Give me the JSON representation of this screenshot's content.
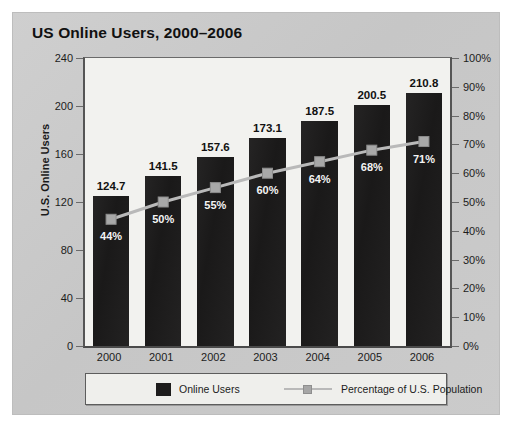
{
  "chart_data": {
    "type": "bar",
    "title": "US Online Users, 2000–2006",
    "categories": [
      "2000",
      "2001",
      "2002",
      "2003",
      "2004",
      "2005",
      "2006"
    ],
    "xlabel": "",
    "ylabel": "U.S. Online Users",
    "ylim": [
      0,
      240
    ],
    "yticks": [
      "0",
      "40",
      "80",
      "120",
      "160",
      "200",
      "240"
    ],
    "y2label": "",
    "y2lim": [
      0,
      100
    ],
    "y2ticks": [
      "0%",
      "10%",
      "20%",
      "30%",
      "40%",
      "50%",
      "60%",
      "70%",
      "80%",
      "90%",
      "100%"
    ],
    "grid": false,
    "legend_position": "bottom",
    "series": [
      {
        "name": "Online Users",
        "kind": "bar",
        "axis": "left",
        "color": "#1d1c1c",
        "values": [
          124.7,
          141.5,
          157.6,
          173.1,
          187.5,
          200.5,
          210.8
        ],
        "data_labels": [
          "124.7",
          "141.5",
          "157.6",
          "173.1",
          "187.5",
          "200.5",
          "210.8"
        ]
      },
      {
        "name": "Percentage of U.S. Population",
        "kind": "line",
        "axis": "right",
        "color": "#b9b9b9",
        "values": [
          44,
          50,
          55,
          60,
          64,
          68,
          71
        ],
        "data_labels": [
          "44%",
          "50%",
          "55%",
          "60%",
          "64%",
          "68%",
          "71%"
        ]
      }
    ]
  },
  "legend": {
    "bars_label": "Online Users",
    "line_label": "Percentage of U.S. Population"
  }
}
